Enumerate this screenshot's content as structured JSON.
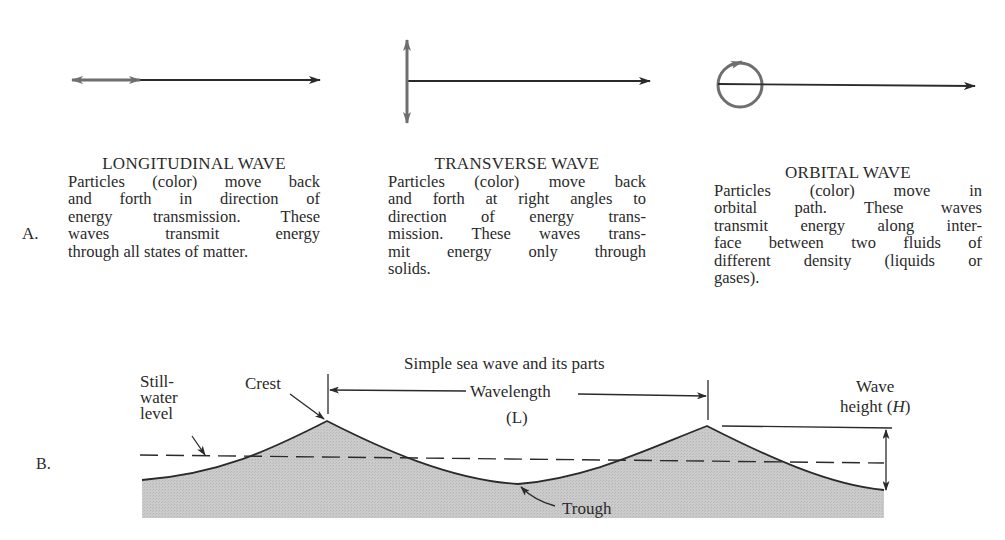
{
  "part_a": {
    "label": "A.",
    "columns": [
      {
        "title": "LONGITUDINAL WAVE",
        "icon": "longitudinal-arrow-icon",
        "lines": [
          "Particles (color) move back",
          "and forth in direction of",
          "energy transmission. These",
          "waves transmit energy",
          "through all states of matter."
        ]
      },
      {
        "title": "TRANSVERSE WAVE",
        "icon": "transverse-arrow-icon",
        "lines": [
          "Particles (color) move back",
          "and forth at right angles to",
          "direction of energy trans-",
          "mission. These waves trans-",
          "mit energy only through",
          "solids."
        ]
      },
      {
        "title": "ORBITAL WAVE",
        "icon": "orbital-arrow-icon",
        "lines": [
          "Particles (color) move in",
          "orbital path. These waves",
          "transmit energy along inter-",
          "face between two fluids of",
          "different density (liquids or",
          "gases)."
        ]
      }
    ]
  },
  "part_b": {
    "label": "B.",
    "title": "Simple sea wave and its parts",
    "labels": {
      "still_water_1": "Still-",
      "still_water_2": "water",
      "still_water_3": "level",
      "crest": "Crest",
      "wavelength": "Wavelength",
      "wavelength_symbol": "(L)",
      "wave_height_1": "Wave",
      "wave_height_2": "height (",
      "wave_height_symbol": "H",
      "wave_height_3": ")",
      "trough": "Trough"
    }
  },
  "colors": {
    "ink": "#2a2a2a",
    "particle": "#6e6e6e",
    "water_fill": "#c8c8c8"
  }
}
